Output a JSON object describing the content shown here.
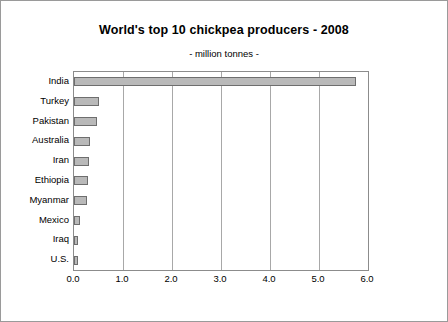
{
  "chart_data": {
    "type": "bar",
    "orientation": "horizontal",
    "title": "World's top 10 chickpea producers - 2008",
    "subtitle": "- million tonnes -",
    "xlabel": "",
    "ylabel": "",
    "categories": [
      "India",
      "Turkey",
      "Pakistan",
      "Australia",
      "Iran",
      "Ethiopia",
      "Myanmar",
      "Mexico",
      "Iraq",
      "U.S."
    ],
    "values": [
      5.75,
      0.52,
      0.47,
      0.33,
      0.31,
      0.28,
      0.26,
      0.13,
      0.09,
      0.09
    ],
    "xlim": [
      0.0,
      6.0
    ],
    "xticks": [
      "0.0",
      "1.0",
      "2.0",
      "3.0",
      "4.0",
      "5.0",
      "6.0"
    ],
    "grid": "vertical",
    "legend": "none",
    "bar_color": "#b9b9b9",
    "bar_border_color": "#6e6e6e",
    "grid_color": "#a8a8a8",
    "frame_color": "#9a9a9a"
  }
}
